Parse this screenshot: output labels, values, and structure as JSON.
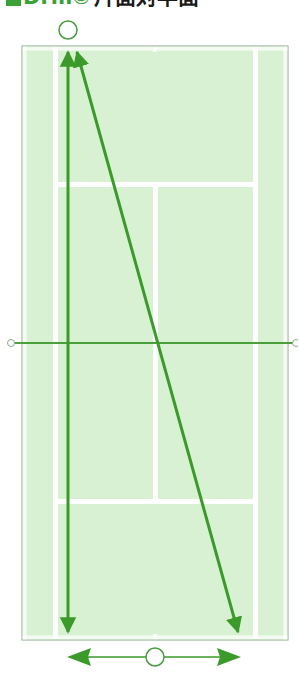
{
  "title": {
    "marker": "■",
    "drill_label": "Drill⑤",
    "description": "片面対半面"
  },
  "colors": {
    "accent": "#3aa136",
    "arrow": "#3a9a2a",
    "court_fill": "#d9f1d3",
    "court_lines": "#ffffff",
    "court_border": "#9cb89a",
    "net": "#4aa03a"
  },
  "diagram": {
    "court": {
      "outer": {
        "x": 22,
        "y": 46,
        "w": 266,
        "h": 594
      },
      "singles_left_x": 55,
      "singles_right_x": 255,
      "service_line_top_y": 184,
      "service_line_bottom_y": 501,
      "center_x": 155,
      "net_y": 343
    },
    "players": [
      {
        "id": "top-player",
        "x": 68,
        "y": 30,
        "r": 9
      },
      {
        "id": "bottom-player",
        "x": 155,
        "y": 657,
        "r": 9
      }
    ],
    "shots": [
      {
        "id": "vertical-double-arrow",
        "from": [
          68,
          52
        ],
        "to": [
          68,
          632
        ],
        "heads": "both"
      },
      {
        "id": "diagonal-double-arrow",
        "from": [
          76,
          52
        ],
        "to": [
          238,
          632
        ],
        "heads": "both"
      }
    ],
    "movement": {
      "id": "bottom-player-lateral-movement",
      "from": [
        67,
        657
      ],
      "to": [
        240,
        657
      ],
      "heads": "both"
    }
  }
}
